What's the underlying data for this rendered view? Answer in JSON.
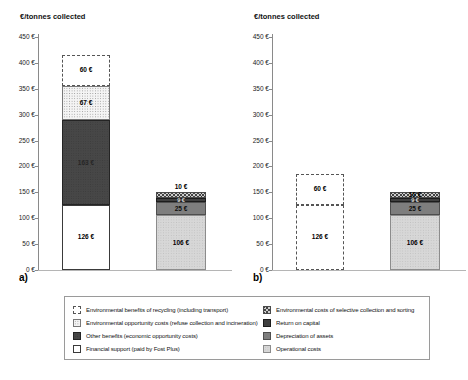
{
  "chart_data": [
    {
      "type": "bar",
      "stacked": true,
      "panel": "a)",
      "ylabel": "€/tonnes collected",
      "ylim": [
        0,
        450
      ],
      "ytick_step": 50,
      "ytick_suffix": " €",
      "bars": [
        {
          "segments": [
            {
              "key": "financial_support",
              "category": "Financial support (paid by Fost Plus)",
              "value": 126,
              "label": "126 €"
            },
            {
              "key": "other_benefits",
              "category": "Other benefits (economic opportunity costs)",
              "value": 163,
              "label": "163 €"
            },
            {
              "key": "env_opportunity",
              "category": "Environmental opportunity costs (refuse collection and incineration)",
              "value": 67,
              "label": "67 €"
            },
            {
              "key": "env_benefits",
              "category": "Environmental benefits of recycling (including transport)",
              "value": 60,
              "label": "60 €"
            }
          ]
        },
        {
          "segments": [
            {
              "key": "operational",
              "category": "Operational costs",
              "value": 106,
              "label": "106 €"
            },
            {
              "key": "depreciation",
              "category": "Depreciation of assets",
              "value": 25,
              "label": "25 €"
            },
            {
              "key": "return_on_capital",
              "category": "Return on capital",
              "value": 9,
              "label": "9 €"
            },
            {
              "key": "env_costs_selective",
              "category": "Environmental costs of selective collection and sorting",
              "value": 10,
              "label": "10 €",
              "label_position": "above"
            }
          ]
        }
      ]
    },
    {
      "type": "bar",
      "stacked": true,
      "panel": "b)",
      "ylabel": "€/tonnes collected",
      "ylim": [
        0,
        450
      ],
      "ytick_step": 50,
      "ytick_suffix": " €",
      "bars": [
        {
          "segments": [
            {
              "key": "financial_support",
              "category": "Financial support (paid by Fost Plus)",
              "value": 126,
              "label": "126 €",
              "variant": "dashed"
            },
            {
              "key": "env_benefits",
              "category": "Environmental benefits of recycling (including transport)",
              "value": 60,
              "label": "60 €"
            }
          ]
        },
        {
          "segments": [
            {
              "key": "operational",
              "category": "Operational costs",
              "value": 106,
              "label": "106 €"
            },
            {
              "key": "depreciation",
              "category": "Depreciation of assets",
              "value": 25,
              "label": "25 €"
            },
            {
              "key": "return_on_capital",
              "category": "Return on capital",
              "value": 9,
              "label": "9 €"
            },
            {
              "key": "env_costs_selective",
              "category": "Environmental costs of selective collection and sorting",
              "value": 10,
              "label": "10 €"
            }
          ]
        }
      ]
    }
  ],
  "legend": {
    "columns": [
      [
        {
          "key": "env_benefits",
          "label": "Environmental benefits of recycling (including transport)"
        },
        {
          "key": "env_opportunity",
          "label": "Environmental opportunity costs (refuse collection and incineration)"
        },
        {
          "key": "other_benefits",
          "label": "Other benefits (economic opportunity costs)"
        },
        {
          "key": "financial_support",
          "label": "Financial support (paid by Fost Plus)"
        }
      ],
      [
        {
          "key": "env_costs_selective",
          "label": "Environmental costs of selective collection and sorting"
        },
        {
          "key": "return_on_capital",
          "label": "Return on capital"
        },
        {
          "key": "depreciation",
          "label": "Depreciation of assets"
        },
        {
          "key": "operational",
          "label": "Operational costs"
        }
      ]
    ]
  }
}
